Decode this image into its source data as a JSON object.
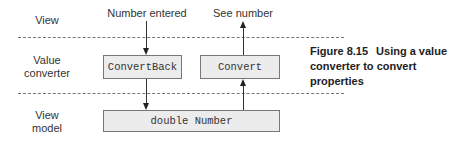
{
  "diagram": {
    "layers": [
      {
        "label": "View"
      },
      {
        "label": "Value converter"
      },
      {
        "label": "View model"
      }
    ],
    "top_labels": {
      "left": "Number entered",
      "right": "See number"
    },
    "boxes": {
      "convert_back": "ConvertBack",
      "convert": "Convert",
      "property": "double Number"
    },
    "caption": {
      "number": "Figure 8.15",
      "text": "Using a value converter to convert properties"
    }
  }
}
